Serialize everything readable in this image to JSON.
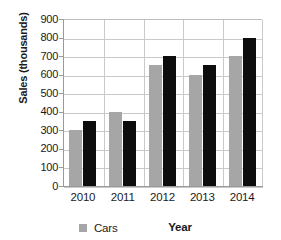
{
  "chart_data": {
    "type": "bar",
    "title": "",
    "xlabel": "Year",
    "ylabel": "Sales (thousands)",
    "categories": [
      "2010",
      "2011",
      "2012",
      "2013",
      "2014"
    ],
    "series": [
      {
        "name": "Cars",
        "color": "#a6a6a6",
        "values": [
          300,
          400,
          650,
          600,
          700
        ]
      },
      {
        "name": "",
        "color": "#0d0d0d",
        "values": [
          350,
          350,
          700,
          650,
          800
        ]
      }
    ],
    "ylim": [
      0,
      900
    ],
    "ytick_step": 100,
    "yticks": [
      900,
      800,
      700,
      600,
      500,
      400,
      300,
      200,
      100,
      0
    ],
    "grid": true,
    "legend": {
      "position": "bottom-left",
      "entries": [
        {
          "label": "Cars",
          "color": "#a6a6a6"
        }
      ]
    },
    "plot_background": "#ffffff",
    "gridline_color": "#c9c9c9",
    "axis_color": "#9a9a9a"
  }
}
